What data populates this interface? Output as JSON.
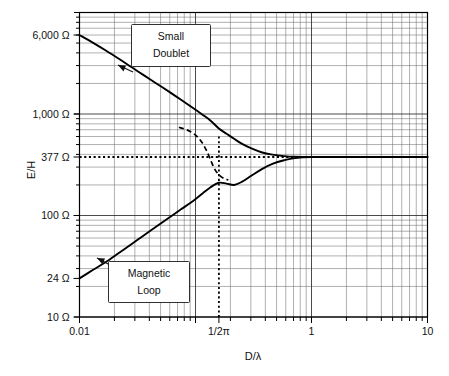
{
  "chart_data": {
    "type": "line",
    "title": "",
    "xlabel": "D/λ",
    "ylabel": "E/H",
    "xscale": "log",
    "yscale": "log",
    "xlim": [
      0.01,
      10
    ],
    "ylim": [
      10,
      10000
    ],
    "grid": "log-minor-and-major",
    "legend_position": "inline-callouts",
    "x_ticks": [
      {
        "value": 0.01,
        "label": "0.01"
      },
      {
        "value": 0.159155,
        "label": "1/2π"
      },
      {
        "value": 1,
        "label": "1"
      },
      {
        "value": 10,
        "label": "10"
      }
    ],
    "y_ticks": [
      {
        "value": 6000,
        "label": "6,000 Ω"
      },
      {
        "value": 1000,
        "label": "1,000 Ω"
      },
      {
        "value": 377,
        "label": "377 Ω"
      },
      {
        "value": 100,
        "label": "100 Ω"
      },
      {
        "value": 24,
        "label": "24 Ω"
      },
      {
        "value": 10,
        "label": "10 Ω"
      }
    ],
    "reference_lines": [
      {
        "name": "far-field-impedance",
        "orientation": "horizontal",
        "value": 377,
        "style": "dotted",
        "label": "377 Ω"
      },
      {
        "name": "near-far-boundary",
        "orientation": "vertical",
        "value": 0.159155,
        "style": "dotted",
        "label": "1/2π"
      }
    ],
    "series": [
      {
        "name": "Small Doublet",
        "style": "solid",
        "annotation": "Small Doublet",
        "points": [
          [
            0.01,
            6000
          ],
          [
            0.013,
            5050
          ],
          [
            0.017,
            4200
          ],
          [
            0.022,
            3480
          ],
          [
            0.028,
            2900
          ],
          [
            0.036,
            2400
          ],
          [
            0.046,
            2000
          ],
          [
            0.059,
            1660
          ],
          [
            0.075,
            1380
          ],
          [
            0.096,
            1140
          ],
          [
            0.115,
            985
          ],
          [
            0.135,
            860
          ],
          [
            0.159,
            720
          ],
          [
            0.185,
            640
          ],
          [
            0.215,
            570
          ],
          [
            0.25,
            510
          ],
          [
            0.3,
            460
          ],
          [
            0.37,
            420
          ],
          [
            0.46,
            398
          ],
          [
            0.58,
            385
          ],
          [
            0.72,
            379
          ],
          [
            1.0,
            377
          ],
          [
            2.0,
            377
          ],
          [
            5.0,
            377
          ],
          [
            10,
            377
          ]
        ]
      },
      {
        "name": "Magnetic Loop",
        "style": "solid",
        "annotation": "Magnetic Loop",
        "points": [
          [
            0.01,
            24
          ],
          [
            0.013,
            29
          ],
          [
            0.017,
            35
          ],
          [
            0.022,
            43
          ],
          [
            0.028,
            52
          ],
          [
            0.036,
            64
          ],
          [
            0.046,
            78
          ],
          [
            0.059,
            95
          ],
          [
            0.075,
            115
          ],
          [
            0.096,
            140
          ],
          [
            0.115,
            165
          ],
          [
            0.135,
            190
          ],
          [
            0.159,
            210
          ],
          [
            0.185,
            206
          ],
          [
            0.215,
            200
          ],
          [
            0.25,
            214
          ],
          [
            0.3,
            245
          ],
          [
            0.37,
            285
          ],
          [
            0.46,
            322
          ],
          [
            0.58,
            350
          ],
          [
            0.72,
            368
          ],
          [
            1.0,
            377
          ],
          [
            2.0,
            377
          ],
          [
            5.0,
            377
          ],
          [
            10,
            377
          ]
        ]
      },
      {
        "name": "transition-dashed",
        "style": "dashed",
        "annotation": "",
        "points": [
          [
            0.072,
            740
          ],
          [
            0.086,
            690
          ],
          [
            0.1,
            620
          ],
          [
            0.113,
            530
          ],
          [
            0.124,
            440
          ],
          [
            0.134,
            360
          ],
          [
            0.145,
            292
          ],
          [
            0.159,
            252
          ],
          [
            0.175,
            232
          ],
          [
            0.192,
            224
          ]
        ]
      }
    ],
    "annotations": [
      {
        "name": "small-doublet-callout",
        "text_lines": [
          "Small",
          "Doublet"
        ]
      },
      {
        "name": "magnetic-loop-callout",
        "text_lines": [
          "Magnetic",
          "Loop"
        ]
      }
    ]
  },
  "axes": {
    "y_label": "E/H",
    "x_label": "D/λ",
    "y_tick_labels": [
      "6,000 Ω",
      "1,000 Ω",
      "377 Ω",
      "100 Ω",
      "24 Ω",
      "10 Ω"
    ],
    "x_tick_labels": [
      "0.01",
      "1/2π",
      "1",
      "10"
    ]
  },
  "callouts": {
    "small_doublet": {
      "line1": "Small",
      "line2": "Doublet"
    },
    "magnetic_loop": {
      "line1": "Magnetic",
      "line2": "Loop"
    }
  },
  "colors": {
    "background": "#ffffff",
    "curve": "#000000",
    "grid_major": "#2b2b2b",
    "grid_minor": "#6e6e6e",
    "frame": "#000000",
    "text": "#111111"
  }
}
